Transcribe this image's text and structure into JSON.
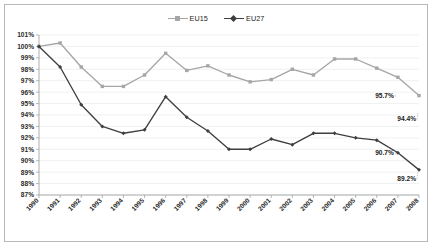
{
  "legend": {
    "position": "top-center",
    "entries": [
      {
        "label": "EU15",
        "color": "#a6a6a6",
        "marker": "square"
      },
      {
        "label": "EU27",
        "color": "#3f3f3f",
        "marker": "diamond"
      }
    ]
  },
  "axes": {
    "y_ticks": [
      "87%",
      "88%",
      "89%",
      "90%",
      "91%",
      "92%",
      "93%",
      "94%",
      "95%",
      "96%",
      "97%",
      "98%",
      "99%",
      "100%",
      "101%"
    ],
    "x_ticks": [
      "1990",
      "1991",
      "1992",
      "1993",
      "1994",
      "1995",
      "1996",
      "1997",
      "1998",
      "1999",
      "2000",
      "2001",
      "2002",
      "2003",
      "2004",
      "2005",
      "2006",
      "2007",
      "2008"
    ]
  },
  "annotations": [
    {
      "text": "95.7%",
      "series": "EU15",
      "year": "2007",
      "value": 95.7
    },
    {
      "text": "94.4%",
      "series": "EU15",
      "year": "2008",
      "value": 94.4
    },
    {
      "text": "90.7%",
      "series": "EU27",
      "year": "2007",
      "value": 90.7
    },
    {
      "text": "89.2%",
      "series": "EU27",
      "year": "2008",
      "value": 89.2
    }
  ],
  "chart_data": {
    "type": "line",
    "title": "",
    "subtitle": "",
    "xlabel": "",
    "ylabel": "",
    "x": [
      "1990",
      "1991",
      "1992",
      "1993",
      "1994",
      "1995",
      "1996",
      "1997",
      "1998",
      "1999",
      "2000",
      "2001",
      "2002",
      "2003",
      "2004",
      "2005",
      "2006",
      "2007",
      "2008"
    ],
    "ylim": [
      87,
      101
    ],
    "ytick_step": 1,
    "grid": true,
    "legend_position": "top-center",
    "series": [
      {
        "name": "EU15",
        "color": "#a6a6a6",
        "marker": "square",
        "values": [
          100.0,
          100.3,
          98.2,
          96.5,
          96.5,
          97.5,
          99.4,
          97.9,
          98.3,
          97.5,
          96.9,
          97.1,
          98.0,
          97.5,
          98.9,
          98.9,
          98.1,
          97.3,
          95.7
        ]
      },
      {
        "name": "EU27",
        "color": "#3f3f3f",
        "marker": "diamond",
        "values": [
          100.0,
          98.2,
          94.9,
          93.0,
          92.4,
          92.7,
          95.6,
          93.8,
          92.6,
          91.0,
          91.0,
          91.9,
          91.4,
          92.4,
          92.4,
          92.0,
          91.8,
          90.7,
          89.2
        ]
      }
    ]
  }
}
